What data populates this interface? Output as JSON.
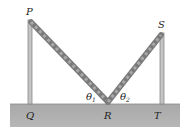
{
  "labels": {
    "P": "P",
    "S": "S",
    "Q": "Q",
    "R": "R",
    "T": "T",
    "theta1": "θ",
    "theta1_sub": "1",
    "theta2": "θ",
    "theta2_sub": "2"
  },
  "colors": {
    "ground": "#a8a8a8",
    "pole": "#bdbdbd",
    "pole_edge": "#8a8a8a",
    "rope": "#9a9a9a",
    "rope_stripe": "#6e6e6e",
    "text": "#222222"
  }
}
